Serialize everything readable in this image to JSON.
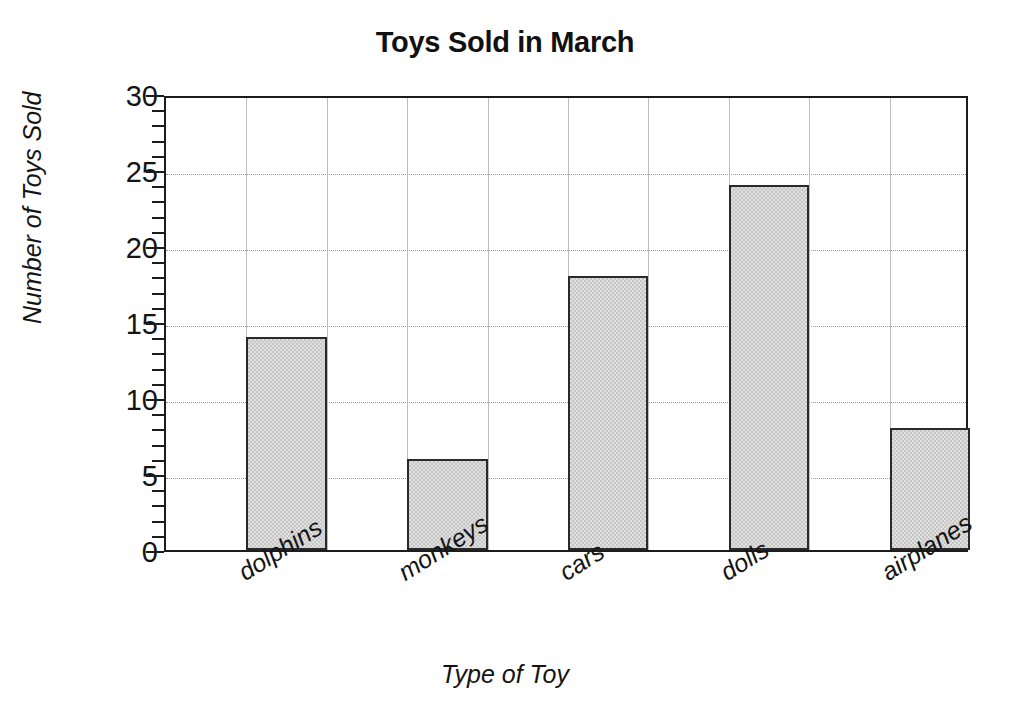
{
  "chart_data": {
    "type": "bar",
    "title": "Toys Sold in March",
    "xlabel": "Type of Toy",
    "ylabel": "Number of Toys Sold",
    "categories": [
      "dolphins",
      "monkeys",
      "cars",
      "dolls",
      "airplanes"
    ],
    "values": [
      14,
      6,
      18,
      24,
      8
    ],
    "ylim": [
      0,
      30
    ],
    "ytick_labels": [
      "0",
      "5",
      "10",
      "15",
      "20",
      "25",
      "30"
    ],
    "ytick_values": [
      0,
      5,
      10,
      15,
      20,
      25,
      30
    ],
    "yminor_step": 1,
    "grid": "both",
    "legend": "none",
    "bar_fill_color": "#c6c6c6",
    "bar_border_color": "#2a2a2a",
    "gridline_color": "#9a9a9a",
    "axis_color": "#1c1c1c",
    "text_color": "#141414"
  }
}
